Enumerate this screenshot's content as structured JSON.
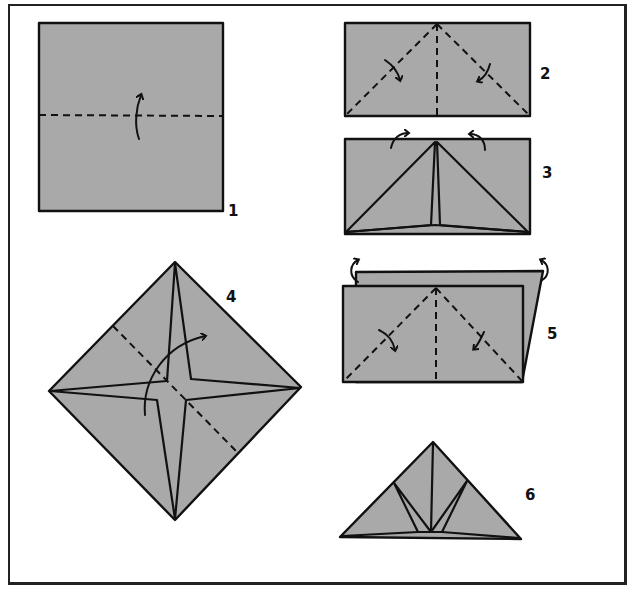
{
  "diagram": {
    "colors": {
      "paper": "#a9a9a9",
      "line": "#111111",
      "background": "#ffffff"
    },
    "steps": [
      {
        "number": "1",
        "description": "Square with horizontal valley fold, fold bottom up"
      },
      {
        "number": "2",
        "description": "Rectangle with diagonal folds from top center to bottom corners"
      },
      {
        "number": "3",
        "description": "Triangular flaps folded down, arrows indicate turning over"
      },
      {
        "number": "4",
        "description": "Diamond with four-point star, fold along diagonal dashed line"
      },
      {
        "number": "5",
        "description": "Layered rectangle with diagonal folds, back layer turned"
      },
      {
        "number": "6",
        "description": "Finished triangular shape with inner flaps"
      }
    ]
  }
}
